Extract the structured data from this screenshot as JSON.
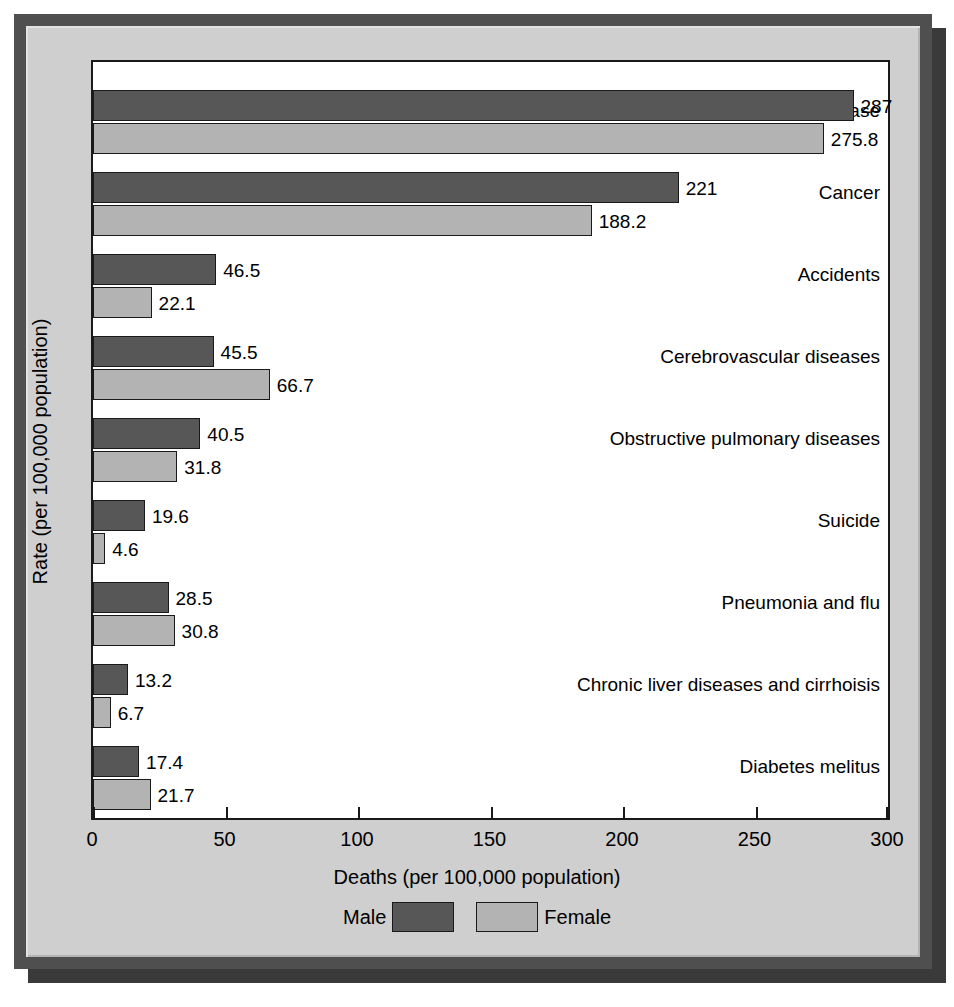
{
  "chart_data": {
    "type": "bar",
    "orientation": "horizontal",
    "title": "",
    "xlabel": "Deaths (per 100,000 population)",
    "ylabel": "Rate (per 100,000 population)",
    "xlim": [
      0,
      300
    ],
    "xticks": [
      "0",
      "50",
      "100",
      "150",
      "200",
      "250",
      "300"
    ],
    "grid": false,
    "legend_position": "bottom",
    "categories": [
      "Heart disease",
      "Cancer",
      "Accidents",
      "Cerebrovascular diseases",
      "Obstructive pulmonary diseases",
      "Suicide",
      "Pneumonia and flu",
      "Chronic liver diseases and cirrhoisis",
      "Diabetes melitus"
    ],
    "series": [
      {
        "name": "Male",
        "color": "#575757",
        "values": [
          287,
          221,
          46.5,
          45.5,
          40.5,
          19.6,
          28.5,
          13.2,
          17.4
        ],
        "labels": [
          "287",
          "221",
          "46.5",
          "45.5",
          "40.5",
          "19.6",
          "28.5",
          "13.2",
          "17.4"
        ]
      },
      {
        "name": "Female",
        "color": "#b3b3b3",
        "values": [
          275.8,
          188.2,
          22.1,
          66.7,
          31.8,
          4.6,
          30.8,
          6.7,
          21.7
        ],
        "labels": [
          "275.8",
          "188.2",
          "22.1",
          "66.7",
          "31.8",
          "4.6",
          "30.8",
          "6.7",
          "21.7"
        ]
      }
    ]
  },
  "legend": {
    "male_label": "Male",
    "female_label": "Female"
  },
  "colors": {
    "male": "#575757",
    "female": "#b3b3b3",
    "frame_outer": "#4f4f4f",
    "frame_panel": "#cfcfcf",
    "plot_background": "#ffffff",
    "axis": "#1a1a1a"
  }
}
